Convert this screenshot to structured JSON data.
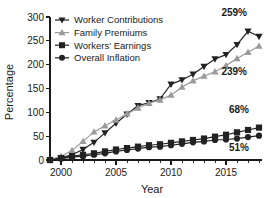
{
  "chart_data": {
    "type": "line",
    "title": "",
    "xlabel": "Year",
    "ylabel": "Percentage",
    "xlim": [
      1999,
      2018
    ],
    "ylim": [
      0,
      300
    ],
    "xticks": [
      2000,
      2005,
      2010,
      2015
    ],
    "xtick_labels": [
      "2000",
      "2005",
      "2010",
      "2015"
    ],
    "yticks": [
      0,
      50,
      100,
      150,
      200,
      250,
      300
    ],
    "ytick_labels": [
      "0",
      "50",
      "100",
      "150",
      "200",
      "250",
      "300"
    ],
    "grid": false,
    "legend_position": "top-left",
    "x": [
      1999,
      2000,
      2001,
      2002,
      2003,
      2004,
      2005,
      2006,
      2007,
      2008,
      2009,
      2010,
      2011,
      2012,
      2013,
      2014,
      2015,
      2016,
      2017,
      2018
    ],
    "series": [
      {
        "name": "Worker Contributions",
        "marker": "triangle-down",
        "color": "#222222",
        "end_label": "259%",
        "values": [
          0,
          5,
          11,
          22,
          37,
          57,
          77,
          96,
          114,
          120,
          128,
          159,
          168,
          180,
          196,
          212,
          221,
          242,
          270,
          259
        ]
      },
      {
        "name": "Family Premiums",
        "marker": "triangle-up",
        "color": "#9a9a9a",
        "end_label": "239%",
        "values": [
          0,
          8,
          20,
          39,
          59,
          72,
          84,
          97,
          109,
          119,
          126,
          136,
          153,
          166,
          176,
          185,
          198,
          213,
          226,
          239
        ]
      },
      {
        "name": "Workers' Earnings",
        "marker": "square",
        "color": "#222222",
        "end_label": "68%",
        "values": [
          0,
          4,
          8,
          11,
          14,
          18,
          22,
          25,
          28,
          31,
          33,
          36,
          39,
          42,
          45,
          49,
          53,
          58,
          63,
          68
        ]
      },
      {
        "name": "Overall Inflation",
        "marker": "circle",
        "color": "#222222",
        "end_label": "51%",
        "values": [
          0,
          3,
          6,
          8,
          11,
          14,
          18,
          21,
          24,
          27,
          28,
          31,
          34,
          37,
          39,
          42,
          43,
          45,
          48,
          51
        ]
      }
    ],
    "annotations": [
      {
        "text": "259%",
        "series": "Worker Contributions"
      },
      {
        "text": "239%",
        "series": "Family Premiums"
      },
      {
        "text": "68%",
        "series": "Workers' Earnings"
      },
      {
        "text": "51%",
        "series": "Overall Inflation"
      }
    ],
    "colors": {
      "dark": "#222222",
      "gray": "#9a9a9a",
      "axis": "#1a1a1a",
      "background": "#ffffff"
    }
  }
}
